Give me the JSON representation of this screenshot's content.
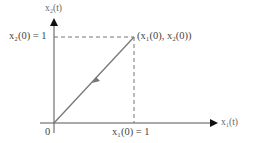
{
  "diagram": {
    "y_axis_label": "x₂(t)",
    "x_axis_label": "x₁(t)",
    "origin_label": "0",
    "y_tick_label": "x₂(0) = 1",
    "x_tick_label": "x₁(0) = 1",
    "point_label": "(x₁(0), x₂(0))",
    "colors": {
      "axis": "#222222",
      "trajectory": "#777777",
      "dashed": "#666666",
      "text": "#444444"
    }
  }
}
